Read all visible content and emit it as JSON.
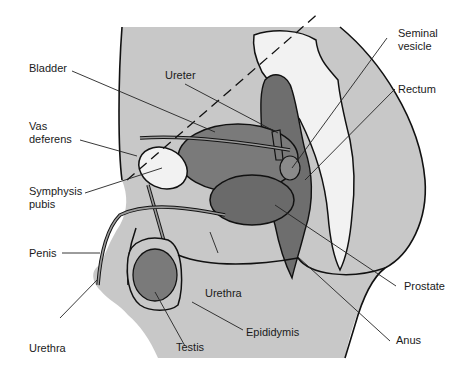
{
  "diagram": {
    "type": "anatomical-illustration",
    "colors": {
      "background": "#ffffff",
      "body_fill": "#c8c8c8",
      "outline": "#111111",
      "bone_fill": "#f2f2f2",
      "organ_fill": "#7a7a7a",
      "organ_dark": "#555555",
      "leader_line": "#222222"
    }
  },
  "labels": [
    {
      "id": "bladder",
      "text": "Bladder"
    },
    {
      "id": "ureter",
      "text": "Ureter"
    },
    {
      "id": "vas-deferens",
      "text": "Vas\ndeferens"
    },
    {
      "id": "symphysis-pubis",
      "text": "Symphysis\npubis"
    },
    {
      "id": "penis",
      "text": "Penis"
    },
    {
      "id": "urethra-left",
      "text": "Urethra"
    },
    {
      "id": "urethra-center",
      "text": "Urethra"
    },
    {
      "id": "testis",
      "text": "Testis"
    },
    {
      "id": "epididymis",
      "text": "Epididymis"
    },
    {
      "id": "seminal-vesicle",
      "text": "Seminal\nvesicle"
    },
    {
      "id": "rectum",
      "text": "Rectum"
    },
    {
      "id": "prostate",
      "text": "Prostate"
    },
    {
      "id": "anus",
      "text": "Anus"
    }
  ]
}
